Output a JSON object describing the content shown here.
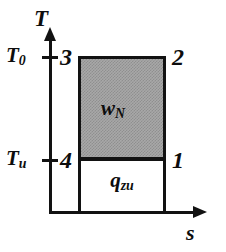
{
  "chart_data": {
    "type": "line",
    "title": "",
    "xlabel": "s",
    "ylabel": "T",
    "axes": {
      "x_axis_label": "s",
      "y_axis_label": "T",
      "y_tick_labels": [
        "T_0",
        "T_u"
      ],
      "grid": false,
      "legend": false
    },
    "y_ticks": [
      {
        "id": "t0",
        "label_main": "T",
        "label_sub": "0",
        "value_name": "T_0"
      },
      {
        "id": "tu",
        "label_main": "T",
        "label_sub": "u",
        "value_name": "T_u"
      }
    ],
    "state_points": [
      {
        "id": "3",
        "label": "3",
        "temperature": "T_0",
        "position": "top-left"
      },
      {
        "id": "2",
        "label": "2",
        "temperature": "T_0",
        "position": "top-right"
      },
      {
        "id": "4",
        "label": "4",
        "temperature": "T_u",
        "position": "middle-left"
      },
      {
        "id": "1",
        "label": "1",
        "temperature": "T_u",
        "position": "middle-right"
      }
    ],
    "areas": [
      {
        "id": "work",
        "label_main": "w",
        "label_sub": "N",
        "label": "w_N",
        "fill": "hatched-gray",
        "color": "#a8a8a8",
        "bounds": {
          "x0": 78,
          "y0": 56,
          "x1": 166,
          "y1": 160
        },
        "corners": [
          "3",
          "2",
          "1",
          "4"
        ]
      },
      {
        "id": "heat-added",
        "label_main": "q",
        "label_sub": "zu",
        "label": "q_zu",
        "fill": "white",
        "color": "#ffffff",
        "bounds": {
          "x0": 78,
          "y0": 158,
          "x1": 166,
          "y1": 214
        },
        "corners": [
          "4",
          "1"
        ]
      }
    ],
    "colors": {
      "line": "#121212",
      "shaded_area": "#a8a8a8",
      "background": "#ffffff"
    }
  },
  "axis": {
    "vertical_label": "T",
    "horizontal_label": "s"
  },
  "ticks": {
    "t0": {
      "main": "T",
      "sub": "0"
    },
    "tu": {
      "main": "T",
      "sub": "u"
    }
  },
  "areas": {
    "work": {
      "main": "w",
      "sub": "N"
    },
    "heat": {
      "main": "q",
      "sub": "zu"
    }
  },
  "points": {
    "p1": "1",
    "p2": "2",
    "p3": "3",
    "p4": "4"
  }
}
